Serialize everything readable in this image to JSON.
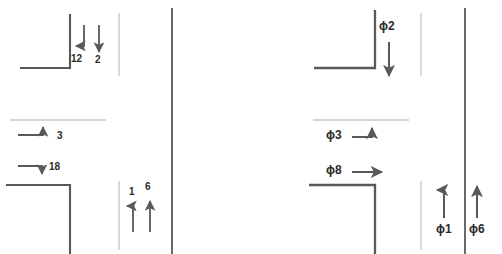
{
  "diagram": {
    "type": "intersection-movement-diagram",
    "panels": [
      {
        "id": "left",
        "name": "numbered-movement-panel",
        "labels": [
          {
            "id": "m12",
            "text": "12",
            "kind": "number",
            "movement": "southbound-left-turn",
            "x": 74,
            "y": 55,
            "arrow": "down-then-left"
          },
          {
            "id": "m2",
            "text": "2",
            "kind": "number",
            "movement": "southbound-through",
            "x": 95,
            "y": 56,
            "arrow": "down"
          },
          {
            "id": "m3",
            "text": "3",
            "kind": "number",
            "movement": "eastbound-right-turn",
            "x": 57,
            "y": 133,
            "arrow": "right-then-up"
          },
          {
            "id": "m18",
            "text": "18",
            "kind": "number",
            "movement": "eastbound-then-down",
            "x": 52,
            "y": 167,
            "arrow": "right-then-down"
          },
          {
            "id": "m1",
            "text": "1",
            "kind": "number",
            "movement": "northbound-left-turn",
            "x": 129,
            "y": 190,
            "arrow": "up-then-left"
          },
          {
            "id": "m6",
            "text": "6",
            "kind": "number",
            "movement": "northbound-through",
            "x": 146,
            "y": 186,
            "arrow": "up"
          }
        ]
      },
      {
        "id": "right",
        "name": "phase-movement-panel",
        "labels": [
          {
            "id": "p2",
            "text": "ϕ2",
            "kind": "phase",
            "movement": "southbound-through",
            "x": 380,
            "y": 20,
            "arrow": "down"
          },
          {
            "id": "p3",
            "text": "ϕ3",
            "kind": "phase",
            "movement": "eastbound-right-turn",
            "x": 327,
            "y": 131,
            "arrow": "right-then-up"
          },
          {
            "id": "p8",
            "text": "ϕ8",
            "kind": "phase",
            "movement": "eastbound-through",
            "x": 327,
            "y": 166,
            "arrow": "right"
          },
          {
            "id": "p1",
            "text": "ϕ1",
            "kind": "phase",
            "movement": "northbound-left-turn",
            "x": 437,
            "y": 224,
            "arrow": "up-then-left"
          },
          {
            "id": "p6",
            "text": "ϕ6",
            "kind": "phase",
            "movement": "northbound-through",
            "x": 470,
            "y": 224,
            "arrow": "up"
          }
        ]
      }
    ],
    "colors": {
      "road_line": "#595959",
      "median_line": "#bfbfbf",
      "arrow": "#595959",
      "label_text": "#2b2b2b",
      "background": "#ffffff"
    }
  }
}
